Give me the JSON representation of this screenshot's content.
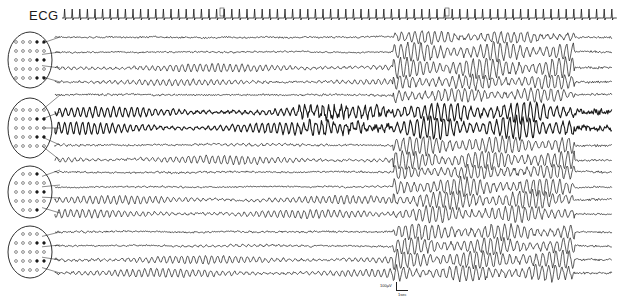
{
  "figure": {
    "ecg_label": "ECG",
    "ecg_markers": [
      "II",
      "III"
    ],
    "scale_bar": {
      "amplitude_label": "100µV",
      "time_label": "1sec"
    },
    "ink_color": "#1a1a1a",
    "background": "#ffffff"
  },
  "ecg": {
    "y": 18,
    "x_start": 62,
    "x_end": 610,
    "beat_spacing": 7.6,
    "marker_positions": [
      220,
      445
    ]
  },
  "head_diagrams": [
    {
      "cx": 30,
      "cy": 60,
      "rx": 22,
      "ry": 28,
      "targets": [
        37,
        52,
        68,
        82
      ]
    },
    {
      "cx": 30,
      "cy": 128,
      "rx": 22,
      "ry": 30,
      "targets": [
        95,
        112,
        128,
        145,
        160
      ]
    },
    {
      "cx": 30,
      "cy": 192,
      "rx": 22,
      "ry": 26,
      "targets": [
        170,
        185,
        198,
        213
      ]
    },
    {
      "cx": 30,
      "cy": 252,
      "rx": 22,
      "ry": 26,
      "targets": [
        232,
        245,
        260,
        273
      ]
    }
  ],
  "channels": [
    {
      "y": 37,
      "pre_amp": 1.5,
      "pre_rhythm": 0,
      "thick": 0,
      "burst_amp": 6
    },
    {
      "y": 52,
      "pre_amp": 1.2,
      "pre_rhythm": 0.5,
      "thick": 0,
      "burst_amp": 9
    },
    {
      "y": 68,
      "pre_amp": 1.5,
      "pre_rhythm": 4,
      "thick": 0,
      "burst_amp": 10
    },
    {
      "y": 82,
      "pre_amp": 1.5,
      "pre_rhythm": 3,
      "thick": 0,
      "burst_amp": 7
    },
    {
      "y": 95,
      "pre_amp": 1.5,
      "pre_rhythm": 0.5,
      "thick": 0,
      "burst_amp": 7
    },
    {
      "y": 112,
      "pre_amp": 2,
      "pre_rhythm": 5,
      "thick": 1,
      "burst_amp": 10
    },
    {
      "y": 128,
      "pre_amp": 2,
      "pre_rhythm": 6,
      "thick": 1,
      "burst_amp": 11
    },
    {
      "y": 145,
      "pre_amp": 1.5,
      "pre_rhythm": 1,
      "thick": 0,
      "burst_amp": 9
    },
    {
      "y": 160,
      "pre_amp": 1.5,
      "pre_rhythm": 4,
      "thick": 0,
      "burst_amp": 9
    },
    {
      "y": 172,
      "pre_amp": 1.5,
      "pre_rhythm": 0.5,
      "thick": 0,
      "burst_amp": 7
    },
    {
      "y": 187,
      "pre_amp": 1.2,
      "pre_rhythm": 0.5,
      "thick": 0,
      "burst_amp": 9
    },
    {
      "y": 200,
      "pre_amp": 1.5,
      "pre_rhythm": 4,
      "thick": 0,
      "burst_amp": 9
    },
    {
      "y": 214,
      "pre_amp": 1.5,
      "pre_rhythm": 4,
      "thick": 0,
      "burst_amp": 8
    },
    {
      "y": 232,
      "pre_amp": 1.5,
      "pre_rhythm": 0.5,
      "thick": 0,
      "burst_amp": 8
    },
    {
      "y": 246,
      "pre_amp": 1.2,
      "pre_rhythm": 1,
      "thick": 0,
      "burst_amp": 8
    },
    {
      "y": 260,
      "pre_amp": 1.5,
      "pre_rhythm": 4,
      "thick": 0,
      "burst_amp": 9
    },
    {
      "y": 273,
      "pre_amp": 1.5,
      "pre_rhythm": 4,
      "thick": 0,
      "burst_amp": 8
    }
  ],
  "layout": {
    "trace_x_start": 55,
    "trace_x_end": 612,
    "burst_start": 393,
    "burst_end": 575,
    "thick_band_start": 298,
    "thick_band_end": 393
  }
}
